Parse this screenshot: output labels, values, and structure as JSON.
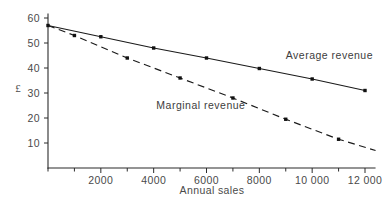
{
  "chart_data": {
    "type": "line",
    "title": "",
    "subtitle": "",
    "xlabel": "Annual sales",
    "ylabel": "£",
    "xlim": [
      0,
      12500
    ],
    "ylim": [
      0,
      62
    ],
    "grid": false,
    "legend_position": "inline-annotation",
    "x_ticks": [
      0,
      1000,
      2000,
      3000,
      4000,
      5000,
      6000,
      7000,
      8000,
      9000,
      10000,
      11000,
      12000
    ],
    "x_tick_labels": [
      "",
      "",
      "2000",
      "",
      "4000",
      "",
      "6000",
      "",
      "8000",
      "",
      "10 000",
      "",
      "12 000"
    ],
    "y_ticks": [
      10,
      20,
      30,
      40,
      50,
      60
    ],
    "y_tick_labels": [
      "10",
      "20",
      "30",
      "40",
      "50",
      "60"
    ],
    "series": [
      {
        "name": "Average revenue",
        "style": "solid",
        "label_x": 9000,
        "label_y": 43.5,
        "x": [
          0,
          2000,
          4000,
          6000,
          8000,
          10000,
          12000
        ],
        "values": [
          57,
          52.5,
          48,
          44,
          39.8,
          35.6,
          31
        ]
      },
      {
        "name": "Marginal revenue",
        "style": "dashed",
        "label_x": 4100,
        "label_y": 23.5,
        "x": [
          0,
          1000,
          3000,
          5000,
          7000,
          9000,
          11000,
          12400
        ],
        "values": [
          57,
          53,
          44,
          36,
          28,
          19.5,
          11.5,
          7
        ]
      }
    ],
    "annotations": [
      {
        "text": "Average revenue",
        "series": "Average revenue"
      },
      {
        "text": "Marginal revenue",
        "series": "Marginal revenue"
      }
    ]
  },
  "axes": {
    "y_axis_symbol": "£",
    "x_axis_title": "Annual sales"
  }
}
